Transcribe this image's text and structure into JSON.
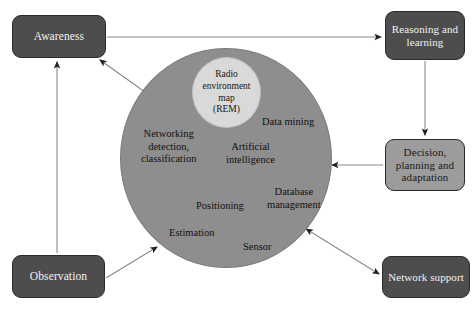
{
  "diagram": {
    "boxes": {
      "awareness": "Awareness",
      "reasoning": "Reasoning and learning",
      "decision": "Decision, planning and adaptation",
      "network_support": "Network support",
      "observation": "Observation"
    },
    "core": {
      "rem": "Radio environment map (REM)",
      "rem_lines": [
        "Radio",
        "environment",
        "map",
        "(REM)"
      ],
      "capabilities": [
        "Data mining",
        "Networking detection, classification",
        "Artificial intelligence",
        "Database management",
        "Positioning",
        "Estimation",
        "Sensor"
      ],
      "capability_lines": {
        "data_mining": [
          "Data mining"
        ],
        "networking": [
          "Networking",
          "detection,",
          "classification"
        ],
        "artificial_intelligence": [
          "Artificial",
          "intelligence"
        ],
        "database_management": [
          "Database",
          "management"
        ],
        "positioning": [
          "Positioning"
        ],
        "estimation": [
          "Estimation"
        ],
        "sensor": [
          "Sensor"
        ]
      }
    },
    "edges": [
      {
        "name": "awareness-to-reasoning",
        "from": "Awareness",
        "to": "Reasoning and learning",
        "style": "straight",
        "direction": "one-way"
      },
      {
        "name": "reasoning-to-decision",
        "from": "Reasoning and learning",
        "to": "Decision, planning and adaptation",
        "style": "straight",
        "direction": "one-way"
      },
      {
        "name": "decision-to-core",
        "from": "Decision, planning and adaptation",
        "to": "REM core",
        "style": "straight",
        "direction": "one-way"
      },
      {
        "name": "core-to-awareness",
        "from": "REM core",
        "to": "Awareness",
        "style": "diagonal",
        "direction": "one-way"
      },
      {
        "name": "observation-to-awareness",
        "from": "Observation",
        "to": "Awareness",
        "style": "straight",
        "direction": "one-way"
      },
      {
        "name": "observation-to-core",
        "from": "Observation",
        "to": "REM core",
        "style": "diagonal",
        "direction": "one-way"
      },
      {
        "name": "core-network-support",
        "from": "REM core",
        "to": "Network support",
        "style": "diagonal",
        "direction": "two-way"
      }
    ],
    "colors": {
      "box_dark_fill": "#4d4d4d",
      "box_dark_text": "#f2f2f2",
      "box_light_fill": "#9c9c9c",
      "box_light_text": "#1a1a1a",
      "circle_fill": "#8e8e8e",
      "rem_fill": "#d9d9d9",
      "edge_stroke": "#777777",
      "background": "#ffffff"
    }
  }
}
